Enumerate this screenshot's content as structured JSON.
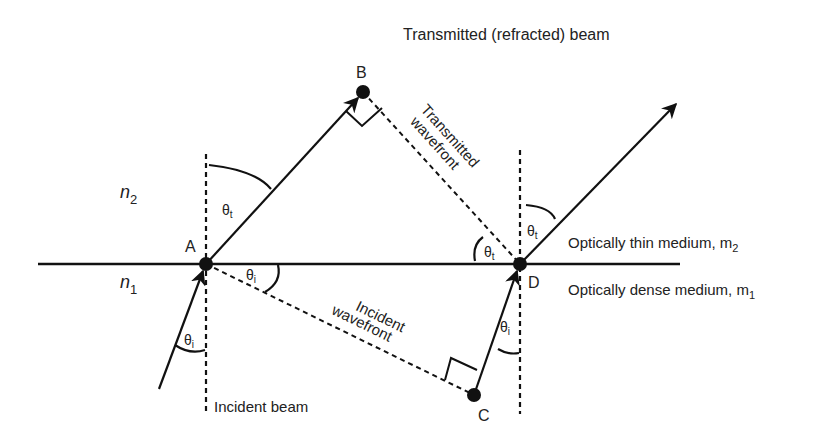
{
  "title": "Transmitted (refracted) beam",
  "media": {
    "upper_index": "n",
    "upper_index_sub": "2",
    "lower_index": "n",
    "lower_index_sub": "1",
    "thin_medium": "Optically thin medium, m",
    "thin_medium_sub": "2",
    "dense_medium": "Optically dense medium, m",
    "dense_medium_sub": "1"
  },
  "points": {
    "A": "A",
    "B": "B",
    "C": "C",
    "D": "D"
  },
  "wavefronts": {
    "transmitted_line1": "Transmitted",
    "transmitted_line2": "wavefront",
    "incident_line1": "Incident",
    "incident_line2": "wavefront"
  },
  "beams": {
    "incident": "Incident beam"
  },
  "angles": {
    "theta": "θ",
    "transmitted_sub": "t",
    "incident_sub": "i"
  },
  "colors": {
    "ink": "#111111",
    "background": "#ffffff"
  }
}
